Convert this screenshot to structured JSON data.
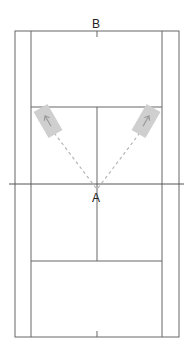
{
  "labels": {
    "top": "B",
    "bottom": "A"
  },
  "colors": {
    "line": "#555555",
    "zone": "#cccccc",
    "dash": "#b5b5b5",
    "arrow": "#999999"
  },
  "court": {
    "outer": {
      "x1": 15,
      "y1": 31,
      "x2": 179,
      "y2": 337
    },
    "singles": {
      "x1": 31,
      "x2": 162
    },
    "service_lines_y": [
      107,
      261
    ],
    "net_y": 184,
    "net_x": [
      9,
      184
    ],
    "center_x": 97
  },
  "targets": [
    {
      "name": "left-target-zone",
      "cx": 48,
      "cy": 121
    },
    {
      "name": "right-target-zone",
      "cx": 146,
      "cy": 121
    }
  ]
}
